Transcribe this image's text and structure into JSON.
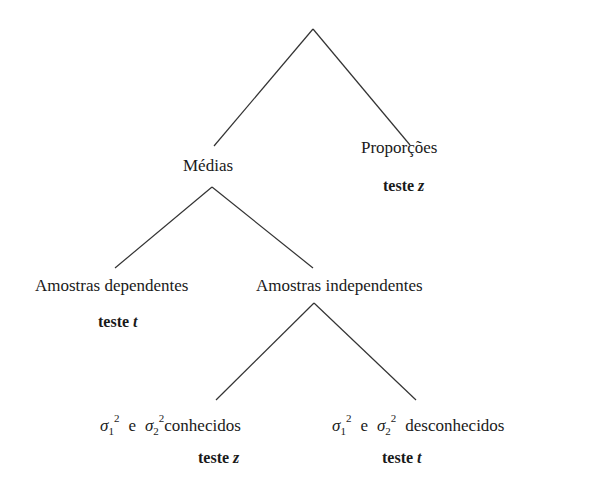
{
  "diagram": {
    "type": "decision-tree",
    "root": {
      "label": "",
      "children": [
        "means",
        "proportions"
      ]
    },
    "nodes": {
      "means": {
        "label": "Médias"
      },
      "proportions": {
        "label": "Proporções",
        "test": {
          "prefix": "teste",
          "var": "z"
        }
      },
      "dependent": {
        "label": "Amostras dependentes",
        "test": {
          "prefix": "teste",
          "var": "t"
        }
      },
      "independent": {
        "label": "Amostras independentes"
      },
      "known": {
        "sigma": "σ",
        "sub1": "1",
        "sub2": "2",
        "sup": "2",
        "conj": "e",
        "label": "conhecidos",
        "test": {
          "prefix": "teste",
          "var": "z"
        }
      },
      "unknown": {
        "sigma": "σ",
        "sub1": "1",
        "sub2": "2",
        "sup": "2",
        "conj": "e",
        "label": "desconhecidos",
        "test": {
          "prefix": "teste",
          "var": "t"
        }
      }
    },
    "edges": [
      {
        "from": "root",
        "to": "means"
      },
      {
        "from": "root",
        "to": "proportions"
      },
      {
        "from": "means",
        "to": "dependent"
      },
      {
        "from": "means",
        "to": "independent"
      },
      {
        "from": "independent",
        "to": "known"
      },
      {
        "from": "independent",
        "to": "unknown"
      }
    ],
    "line_color": "#333333"
  }
}
